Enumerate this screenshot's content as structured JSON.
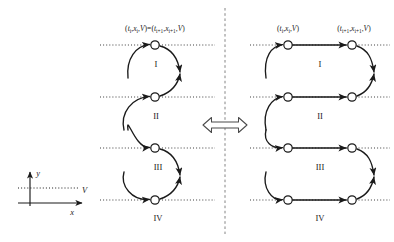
{
  "figure": {
    "title": "",
    "background_color": "#ffffff",
    "stroke_color": "#1a1a1a",
    "node_fill_color": "#ffffff",
    "divider": {
      "name": "vertical-dashed-divider",
      "x": 225,
      "style": "dashed"
    },
    "equivalence": {
      "name": "double-headed-arrow",
      "glyph": "left-right-arrow",
      "x": 225,
      "y": 125
    }
  },
  "labels": {
    "left_panel_equation": "(tᵢ,xᵢ,V)=(tᵢ₊₁,xᵢ₊₁,V)",
    "left_eq_parts": {
      "open1": "(",
      "t_i": "t",
      "t_i_sub": "i",
      "comma1": ",",
      "x_i": "x",
      "x_i_sub": "i",
      "comma2": ",",
      "V1": "V",
      "close1": ")",
      "equals": "=",
      "open2": "(",
      "t_i1": "t",
      "t_i1_sub": "i+1",
      "comma3": ",",
      "x_i1": "x",
      "x_i1_sub": "i+1",
      "comma4": ",",
      "V2": "V",
      "close2": ")"
    },
    "right_panel_equation_left": "(tᵢ,xᵢ,V)",
    "right_panel_equation_right": "(tᵢ₊₁,xᵢ₊₁,V)",
    "rows": [
      "I",
      "II",
      "III",
      "IV"
    ]
  },
  "axes_legend": {
    "name": "axes-legend",
    "y_label": "y",
    "x_label": "x",
    "v_label": "V",
    "origin": {
      "x": 30,
      "y": 200
    }
  },
  "left_panel": {
    "name": "left-panel",
    "description": "Collapsed / identified representation: single node per time slice, curved arrows",
    "node_x": 155,
    "row_y": [
      45,
      97,
      148,
      200
    ],
    "node_radius": 4.2,
    "rows": [
      {
        "label": "I",
        "y": 45,
        "label_pos": {
          "x": 155,
          "y": 66
        }
      },
      {
        "label": "II",
        "y": 97,
        "label_pos": {
          "x": 155,
          "y": 118
        }
      },
      {
        "label": "III",
        "y": 148,
        "label_pos": {
          "x": 155,
          "y": 169
        }
      },
      {
        "label": "IV",
        "y": 200,
        "label_pos": {
          "x": 155,
          "y": 221
        }
      }
    ]
  },
  "right_panel": {
    "name": "right-panel",
    "description": "Unfolded representation: two nodes per time slice joined by a horizontal segment",
    "node_x_left": 288,
    "node_x_right": 352,
    "row_y": [
      45,
      97,
      148,
      200
    ],
    "node_radius": 4.2,
    "rows": [
      {
        "label": "I",
        "y": 45,
        "label_pos": {
          "x": 320,
          "y": 66
        }
      },
      {
        "label": "II",
        "y": 97,
        "label_pos": {
          "x": 320,
          "y": 118
        }
      },
      {
        "label": "III",
        "y": 148,
        "label_pos": {
          "x": 320,
          "y": 169
        }
      },
      {
        "label": "IV",
        "y": 200,
        "label_pos": {
          "x": 320,
          "y": 221
        }
      }
    ]
  },
  "dotted_lines": {
    "name": "time-slice-dotted-lines",
    "left_span": {
      "x1": 100,
      "x2": 215
    },
    "right_span": {
      "x1": 250,
      "x2": 390
    },
    "y_values": [
      45,
      97,
      148,
      200
    ]
  }
}
